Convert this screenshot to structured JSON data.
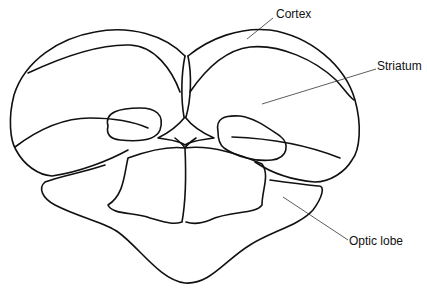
{
  "diagram": {
    "labels": {
      "cortex": "Cortex",
      "striatum": "Striatum",
      "optic_lobe": "Optic lobe"
    },
    "colors": {
      "stroke": "#111111",
      "leader": "#333333",
      "background": "#ffffff"
    }
  }
}
